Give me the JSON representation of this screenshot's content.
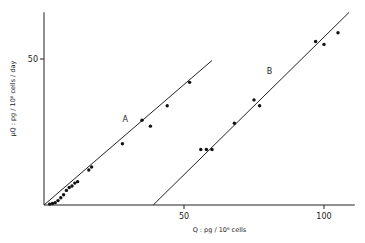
{
  "chart_data": {
    "type": "scatter",
    "title": "",
    "xlabel": "Q : pg / 10⁶ cells",
    "ylabel": "µQ : pg / 10⁶ cells / day",
    "xlim": [
      0,
      111
    ],
    "ylim": [
      0,
      66
    ],
    "x_ticks": [
      {
        "value": 50,
        "label": "50"
      },
      {
        "value": 100,
        "label": "100"
      }
    ],
    "y_ticks": [
      {
        "value": 50,
        "label": "50"
      }
    ],
    "grid": false,
    "series": [
      {
        "name": "A",
        "points": [
          [
            2,
            0.3
          ],
          [
            3,
            0.5
          ],
          [
            4,
            0.8
          ],
          [
            5,
            1.5
          ],
          [
            6,
            2.5
          ],
          [
            7,
            3.5
          ],
          [
            8,
            5
          ],
          [
            9,
            6
          ],
          [
            10,
            6.5
          ],
          [
            11,
            7.5
          ],
          [
            12,
            8
          ],
          [
            16,
            12
          ],
          [
            17,
            13
          ],
          [
            28,
            21
          ],
          [
            35,
            29
          ],
          [
            38,
            27
          ],
          [
            44,
            34
          ],
          [
            52,
            42
          ]
        ],
        "fit_line": [
          [
            0,
            0
          ],
          [
            60,
            49.5
          ]
        ],
        "label_position": [
          29,
          28.5
        ]
      },
      {
        "name": "B",
        "points": [
          [
            56,
            19
          ],
          [
            58,
            19
          ],
          [
            60,
            19
          ],
          [
            68,
            28
          ],
          [
            75,
            36
          ],
          [
            77,
            34
          ],
          [
            97,
            56
          ],
          [
            100,
            55
          ],
          [
            105,
            59
          ]
        ],
        "fit_line": [
          [
            39,
            0
          ],
          [
            109,
            66
          ]
        ],
        "label_position": [
          80.5,
          45
        ]
      }
    ]
  }
}
